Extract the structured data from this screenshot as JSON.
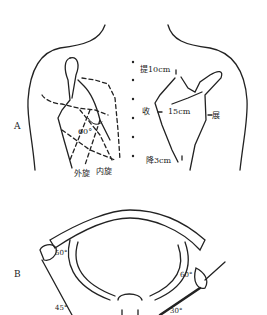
{
  "figure": {
    "panel_a": {
      "label": "A",
      "left_scapula": {
        "angle": "60°",
        "rotation_external": "外旋",
        "rotation_internal": "内旋"
      },
      "right_scapula": {
        "elevation": "提10cm",
        "adduction": "收",
        "distance": "15cm",
        "abduction": "展",
        "depression": "降3cm"
      }
    },
    "panel_b": {
      "label": "B",
      "angles": {
        "left_upper": "50°",
        "left_lower": "45°",
        "right_upper": "60°",
        "right_lower": "30°"
      }
    }
  },
  "colors": {
    "ink": "#222222",
    "background": "#ffffff"
  }
}
